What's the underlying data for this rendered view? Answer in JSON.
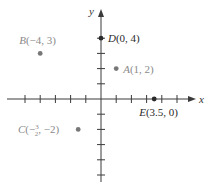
{
  "axes": {
    "x_label": "x",
    "y_label": "y",
    "origin_px": [
      101,
      99
    ],
    "unit_px": 15.2,
    "x_range": [
      -6,
      6
    ],
    "y_range": [
      -5,
      5
    ],
    "x_ticks": [
      -5,
      -4,
      -3,
      -2,
      -1,
      1,
      2,
      3,
      4,
      5
    ],
    "y_ticks": [
      -5,
      -4,
      -3,
      -2,
      -1,
      1,
      2,
      3,
      4
    ],
    "color": "#3a3a3a"
  },
  "points": [
    {
      "name": "A",
      "coords": "(1, 2)",
      "x": 1,
      "y": 2,
      "color": "#777777",
      "label_color": "#8a8a8a",
      "label_pos": "right"
    },
    {
      "name": "B",
      "coords": "(−4, 3)",
      "x": -4,
      "y": 3,
      "color": "#777777",
      "label_color": "#8a8a8a",
      "label_pos": "above"
    },
    {
      "name": "C",
      "coords_pre": "(−",
      "frac_num": "3",
      "frac_den": "2",
      "coords_post": ", −2)",
      "x": -1.5,
      "y": -2,
      "color": "#777777",
      "label_color": "#8a8a8a",
      "label_pos": "left"
    },
    {
      "name": "D",
      "coords": "(0, 4)",
      "x": 0,
      "y": 4,
      "color": "#2a2a2a",
      "label_color": "#2a2a2a",
      "label_pos": "right"
    },
    {
      "name": "E",
      "coords": "(3.5, 0)",
      "x": 3.5,
      "y": 0,
      "color": "#2a2a2a",
      "label_color": "#2a2a2a",
      "label_pos": "below"
    }
  ],
  "labels": {
    "A": "A(1, 2)",
    "B": "B(−4, 3)",
    "D": "D(0, 4)",
    "E": "E(3.5, 0)"
  }
}
